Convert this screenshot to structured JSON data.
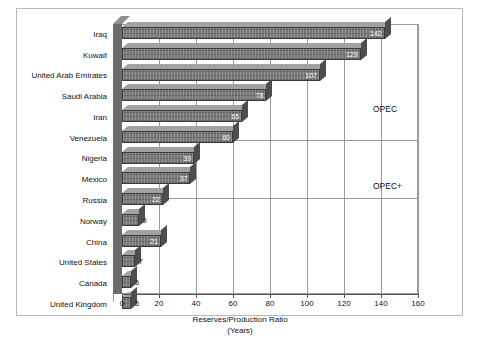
{
  "chart_data": {
    "type": "bar",
    "orientation": "horizontal",
    "title": "",
    "xlabel": "Reserves/Production Ratio",
    "xlabel_line2": "(Years)",
    "ylabel": "",
    "xlim": [
      0,
      160
    ],
    "xticks": [
      0,
      20,
      40,
      60,
      80,
      100,
      120,
      140,
      160
    ],
    "grid": true,
    "legend": "none",
    "categories": [
      "Iraq",
      "Kuwait",
      "United Arab Emirates",
      "Saudi Arabia",
      "Iran",
      "Venezuela",
      "Nigeria",
      "Mexico",
      "Russia",
      "Norway",
      "China",
      "United States",
      "Canada",
      "United Kingdom"
    ],
    "values": [
      142,
      129,
      107,
      78,
      65,
      60,
      39,
      37,
      22,
      9,
      21,
      7,
      5,
      5
    ],
    "value_labels": [
      "142",
      "129",
      "107",
      "78",
      "65",
      "60",
      "39",
      "37",
      "22",
      "9",
      "21",
      "7",
      "5",
      "5"
    ],
    "annotations": [
      {
        "text": "OPEC",
        "group_from": "Iraq",
        "group_to": "Venezuela"
      },
      {
        "text": "OPEC+",
        "group_from": "Nigeria",
        "group_to": "United Kingdom"
      }
    ],
    "bar_color": "#787878",
    "bar_edge_color": "#3a3a3a",
    "grid_color": "#9a9a9a"
  }
}
